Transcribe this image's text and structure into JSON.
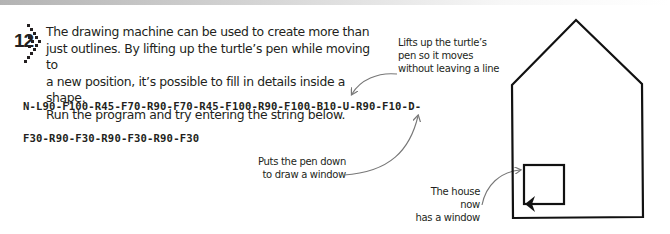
{
  "step": {
    "number": "12",
    "icon": "dotted-chevron-icon",
    "intro_lines": [
      "The drawing machine can be used to create more than",
      "just outlines. By lifting up the turtle’s pen while moving to",
      "a new position, it’s possible to fill in details inside a shape.",
      "Run the program and try entering the string below."
    ]
  },
  "code": {
    "line1": "N-L90-F100-R45-F70-R90-F70-R45-F100-R90-F100-B10-U-R90-F10-D-",
    "line2": "F30-R90-F30-R90-F30-R90-F30"
  },
  "annotations": {
    "lifts_pen": [
      "Lifts up the turtle’s",
      "pen so it moves",
      "without leaving a line"
    ],
    "puts_pen": [
      "Puts the pen down",
      "to draw a window"
    ],
    "house_window": [
      "The house now",
      "has a window"
    ]
  },
  "colors": {
    "text": "#231f20",
    "drawing": "#111111",
    "arrow": "#777777"
  }
}
